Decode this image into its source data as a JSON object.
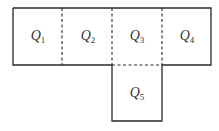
{
  "diagram": {
    "type": "net",
    "squares": [
      {
        "id": "Q1",
        "letter": "Q",
        "subscript": "1",
        "col": 0,
        "row": 0
      },
      {
        "id": "Q2",
        "letter": "Q",
        "subscript": "2",
        "col": 1,
        "row": 0
      },
      {
        "id": "Q3",
        "letter": "Q",
        "subscript": "3",
        "col": 2,
        "row": 0
      },
      {
        "id": "Q4",
        "letter": "Q",
        "subscript": "4",
        "col": 3,
        "row": 0
      },
      {
        "id": "Q5",
        "letter": "Q",
        "subscript": "5",
        "col": 2,
        "row": 1
      }
    ],
    "edges": {
      "solid": "outer boundary",
      "dashed": [
        "Q1|Q2",
        "Q2|Q3",
        "Q3|Q4",
        "Q3|Q5"
      ]
    },
    "colors": {
      "line": "#2a2a2a",
      "text": "#333333",
      "background": "#ffffff"
    }
  }
}
